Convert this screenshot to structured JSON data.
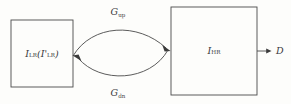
{
  "diagram": {
    "type": "cycle-consistency-block-diagram",
    "background_color": "#fdfdfb",
    "stroke_color": "#4a4a4a",
    "text_color": "#39393b",
    "nodes": [
      {
        "id": "lr-node",
        "name": "low-resolution-image-node",
        "label_main": "I",
        "label_sub": "LR",
        "label_full": "I_LR(I'_LR)",
        "label_paren_main": "I'",
        "label_paren_sub": "LR",
        "x": 11,
        "y": 20,
        "width": 62,
        "height": 67
      },
      {
        "id": "hr-node",
        "name": "high-resolution-image-node",
        "label_main": "I",
        "label_sub": "HR",
        "label_full": "I_HR",
        "x": 171,
        "y": 7,
        "width": 86,
        "height": 88
      }
    ],
    "edges": [
      {
        "id": "edge-up",
        "name": "upsample-generator-edge",
        "label_main": "G",
        "label_sub": "up",
        "label_full": "G_up",
        "from": "lr-node",
        "to": "hr-node",
        "direction": "left-to-right",
        "curve": "arc-above",
        "label_x": 118,
        "label_y": 15
      },
      {
        "id": "edge-dn",
        "name": "downsample-generator-edge",
        "label_main": "G",
        "label_sub": "dn",
        "label_full": "G_dn",
        "from": "hr-node",
        "to": "lr-node",
        "direction": "right-to-left",
        "curve": "arc-below",
        "label_x": 118,
        "label_y": 96
      },
      {
        "id": "edge-out",
        "name": "discriminator-output-edge",
        "label_main": "D",
        "label_sub": "",
        "label_full": "D",
        "from": "hr-node",
        "to": "discriminator",
        "direction": "left-to-right",
        "curve": "straight",
        "label_x": 276,
        "label_y": 51
      }
    ]
  }
}
